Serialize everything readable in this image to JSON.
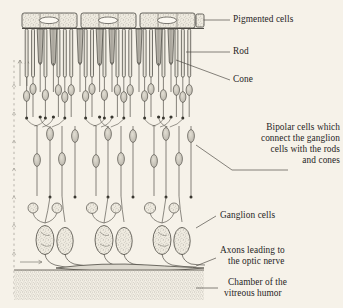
{
  "figure": {
    "background_color": "#f6f2e9",
    "ink_color": "#3a3833",
    "stipple_color": "#8d8a80"
  },
  "labels": {
    "pigmented_cells": "Pigmented cells",
    "rod": "Rod",
    "cone": "Cone",
    "bipolar_line1": "Bipolar cells which",
    "bipolar_line2": "connect the ganglion",
    "bipolar_line3": "cells with the rods",
    "bipolar_line4": "and cones",
    "ganglion_cells": "Ganglion cells",
    "axons_line1": "Axons leading to",
    "axons_line2": "the optic nerve",
    "chamber_line1": "Chamber of the",
    "chamber_line2": "vitreous humor"
  },
  "layers": [
    {
      "name": "pigmented-epithelium",
      "y_top": 12,
      "y_bottom": 30
    },
    {
      "name": "rod-and-cone-outer-segments",
      "y_top": 30,
      "y_bottom": 82
    },
    {
      "name": "outer-nuclear-layer",
      "y_top": 82,
      "y_bottom": 125
    },
    {
      "name": "bipolar-cell-layer",
      "y_top": 125,
      "y_bottom": 190
    },
    {
      "name": "ganglion-cell-layer",
      "y_top": 190,
      "y_bottom": 258
    },
    {
      "name": "nerve-fibre-bundle",
      "y_top": 258,
      "y_bottom": 266
    },
    {
      "name": "vitreous-humor-chamber",
      "y_top": 266,
      "y_bottom": 300
    }
  ],
  "light_direction": {
    "name": "light-path-arrows",
    "description": "dashed vertical guide with upward arrowheads at left margin",
    "direction": "upward"
  },
  "columns": [
    {
      "x_center": 48
    },
    {
      "x_center": 105
    },
    {
      "x_center": 162
    }
  ]
}
